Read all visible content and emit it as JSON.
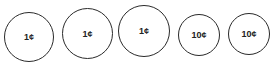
{
  "coins": [
    {
      "label": "1¢",
      "value": 1,
      "x": 4,
      "y": 12,
      "d": 50
    },
    {
      "label": "1¢",
      "value": 1,
      "x": 62,
      "y": 9,
      "d": 51
    },
    {
      "label": "1¢",
      "value": 1,
      "x": 118,
      "y": 6,
      "d": 52
    },
    {
      "label": "10¢",
      "value": 10,
      "x": 178,
      "y": 14,
      "d": 42
    },
    {
      "label": "10¢",
      "value": 10,
      "x": 228,
      "y": 13,
      "d": 42
    }
  ],
  "colors": {
    "outline": "#2a2a2a",
    "text": "#222222",
    "background": "#ffffff"
  }
}
